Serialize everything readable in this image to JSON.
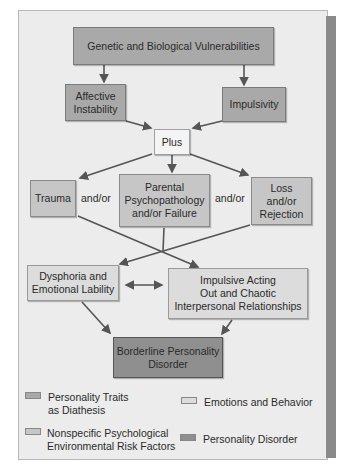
{
  "diagram": {
    "nodes": {
      "genetic": {
        "label": "Genetic and Biological Vulnerabilities",
        "category": "trait"
      },
      "affective": {
        "label": "Affective\nInstability",
        "category": "trait"
      },
      "impulsivity": {
        "label": "Impulsivity",
        "category": "trait"
      },
      "plus": {
        "label": "Plus",
        "category": "connector"
      },
      "trauma": {
        "label": "Trauma",
        "category": "risk"
      },
      "parental": {
        "label": "Parental\nPsychopathology\nand/or Failure",
        "category": "risk"
      },
      "loss": {
        "label": "Loss\nand/or\nRejection",
        "category": "risk"
      },
      "dysphoria": {
        "label": "Dysphoria and\nEmotional Lability",
        "category": "emotion"
      },
      "impulsive_acting": {
        "label": "Impulsive Acting\nOut and Chaotic\nInterpersonal Relationships",
        "category": "emotion"
      },
      "bpd": {
        "label": "Borderline Personality\nDisorder",
        "category": "disorder"
      }
    },
    "connectors": {
      "andor_1": "and/or",
      "andor_2": "and/or"
    },
    "edges": [
      {
        "from": "genetic",
        "to": "affective"
      },
      {
        "from": "genetic",
        "to": "impulsivity"
      },
      {
        "from": "affective",
        "to": "plus"
      },
      {
        "from": "impulsivity",
        "to": "plus"
      },
      {
        "from": "plus",
        "to": "trauma"
      },
      {
        "from": "plus",
        "to": "parental"
      },
      {
        "from": "plus",
        "to": "loss"
      },
      {
        "from": "trauma",
        "to": "impulsive_acting"
      },
      {
        "from": "parental",
        "to": "dysphoria"
      },
      {
        "from": "loss",
        "to": "dysphoria"
      },
      {
        "from": "dysphoria",
        "to": "impulsive_acting",
        "bidirectional": true
      },
      {
        "from": "dysphoria",
        "to": "bpd"
      },
      {
        "from": "impulsive_acting",
        "to": "bpd"
      }
    ],
    "legend": [
      {
        "label": "Personality Traits\nas Diathesis",
        "color": "#a9a9a9"
      },
      {
        "label": "Emotions and Behavior",
        "color": "#dcdcdc"
      },
      {
        "label": "Nonspecific Psychological\nEnvironmental Risk Factors",
        "color": "#c6c6c6"
      },
      {
        "label": "Personality Disorder",
        "color": "#8f8f8f"
      }
    ]
  }
}
